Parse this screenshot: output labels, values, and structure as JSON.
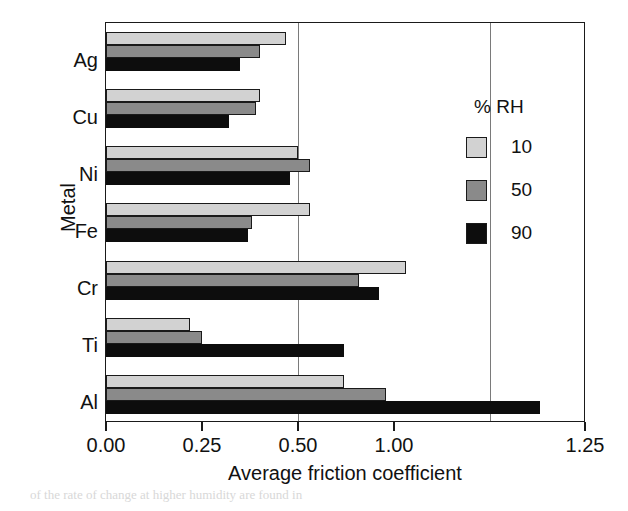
{
  "chart_data": {
    "type": "bar",
    "orientation": "horizontal",
    "title": "",
    "xlabel": "Average friction coefficient",
    "ylabel": "Metal",
    "categories": [
      "Ag",
      "Cu",
      "Ni",
      "Fe",
      "Cr",
      "Ti",
      "Al"
    ],
    "xlim": [
      0.0,
      1.25
    ],
    "xticks": [
      0.0,
      0.25,
      0.5,
      0.75,
      1.0
    ],
    "xticklabels": [
      "0.00",
      "0.25",
      "0.50",
      "1.00",
      "1.25"
    ],
    "grid": "vertical gridlines at 3rd and 4th tick positions",
    "legend": {
      "title": "% RH",
      "position": "right outside",
      "entries": [
        {
          "label": "10",
          "color": "#d2d2d2"
        },
        {
          "label": "50",
          "color": "#8a8a8a"
        },
        {
          "label": "90",
          "color": "#0d0d0d"
        }
      ]
    },
    "series": [
      {
        "name": "10",
        "color": "#d2d2d2",
        "values": [
          0.47,
          0.4,
          0.5,
          0.53,
          0.78,
          0.22,
          0.62
        ]
      },
      {
        "name": "50",
        "color": "#8a8a8a",
        "values": [
          0.4,
          0.39,
          0.53,
          0.38,
          0.66,
          0.25,
          0.73
        ]
      },
      {
        "name": "90",
        "color": "#0d0d0d",
        "values": [
          0.35,
          0.32,
          0.48,
          0.37,
          0.71,
          0.62,
          1.13
        ]
      }
    ]
  },
  "axis": {
    "ylabel": "Metal",
    "xlabel": "Average friction coefficient",
    "xticklabels": [
      "0.00",
      "0.25",
      "0.50",
      "1.00",
      "1.25"
    ],
    "categories": [
      "Ag",
      "Cu",
      "Ni",
      "Fe",
      "Cr",
      "Ti",
      "Al"
    ]
  },
  "legend": {
    "title": "% RH",
    "items": [
      "10",
      "50",
      "90"
    ]
  },
  "page_artifacts": {
    "top_right": "",
    "bottom_caption": "of the rate of change at higher humidity are found in"
  }
}
